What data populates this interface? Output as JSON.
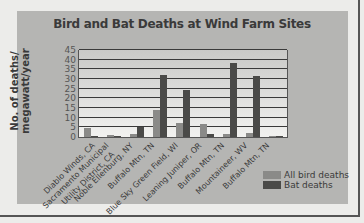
{
  "chart_data": {
    "type": "bar",
    "title": "Bird and Bat Deaths at Wind Farm Sites",
    "xlabel": "",
    "ylabel": "No. of deaths/ megawatt/year",
    "ylim": [
      0,
      45
    ],
    "yticks": [
      0,
      5,
      10,
      15,
      20,
      25,
      30,
      35,
      40,
      45
    ],
    "grid": true,
    "legend_position": "bottom-right",
    "categories": [
      "Diablo Winds, CA",
      "Sacramento Municipal Utility District, CA",
      "Noble Ellenburg, NY",
      "Buffalo Mtn, TN",
      "Blue Sky Green Field, WI",
      "Leaning Juniper, OR",
      "Buffalo Mtn, TN",
      "Mountaineer, WV",
      "Buffalo Mtn, TN"
    ],
    "series": [
      {
        "name": "All bird deaths",
        "color": "#8a8a88",
        "values": [
          4.5,
          1.0,
          1.5,
          14.0,
          7.5,
          6.5,
          1.5,
          2.0,
          0.5
        ]
      },
      {
        "name": "Bat deaths",
        "color": "#4a4a48",
        "values": [
          0.5,
          0.5,
          5.0,
          32.0,
          24.5,
          1.5,
          38.5,
          31.5,
          0.5
        ]
      }
    ]
  },
  "labels": {
    "title": "Bird and Bat Deaths at Wind Farm Sites",
    "ylabel_1": "No. of deaths/",
    "ylabel_2": "megawatt/year",
    "legend_bird": "All bird deaths",
    "legend_bat": "Bat deaths",
    "yticks": [
      "45",
      "40",
      "35",
      "30",
      "25",
      "20",
      "15",
      "10",
      "5",
      "0"
    ],
    "x": [
      "Diablo Winds, CA",
      "Sacramento Municipal",
      "Utility District, CA",
      "Noble Ellenburg, NY",
      "Buffalo Mtn, TN",
      "Blue Sky Green Field, WI",
      "Leaning Juniper, OR",
      "Buffalo Mtn, TN",
      "Mountaineer, WV",
      "Buffalo Mtn, TN"
    ]
  }
}
